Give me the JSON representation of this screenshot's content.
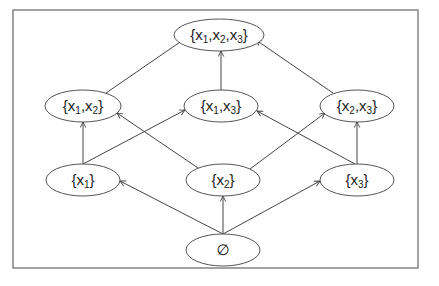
{
  "diagram": {
    "frame": {
      "x": 13,
      "y": 10,
      "width": 405,
      "height": 258
    },
    "nodes": [
      {
        "id": "top",
        "label_parts": [
          "{x",
          "1",
          ",x",
          "2",
          ",x",
          "3",
          "}"
        ],
        "cx": 219,
        "cy": 35,
        "rx": 45,
        "ry": 16
      },
      {
        "id": "x1x2",
        "label_parts": [
          "{x",
          "1",
          ",x",
          "2",
          "}"
        ],
        "cx": 83,
        "cy": 106,
        "rx": 38,
        "ry": 16
      },
      {
        "id": "x1x3",
        "label_parts": [
          "{x",
          "1",
          ",x",
          "3",
          "}"
        ],
        "cx": 221,
        "cy": 106,
        "rx": 37,
        "ry": 16
      },
      {
        "id": "x2x3",
        "label_parts": [
          "{x",
          "2",
          ",x",
          "3",
          "}"
        ],
        "cx": 357,
        "cy": 106,
        "rx": 37,
        "ry": 16
      },
      {
        "id": "x1",
        "label_parts": [
          "{x",
          "1",
          "}"
        ],
        "cx": 83,
        "cy": 180,
        "rx": 37,
        "ry": 16
      },
      {
        "id": "x2",
        "label_parts": [
          "{x",
          "2",
          "}"
        ],
        "cx": 223,
        "cy": 180,
        "rx": 37,
        "ry": 16
      },
      {
        "id": "x3",
        "label_parts": [
          "{x",
          "3",
          "}"
        ],
        "cx": 357,
        "cy": 180,
        "rx": 37,
        "ry": 16
      },
      {
        "id": "empty",
        "label_parts": [
          "∅"
        ],
        "cx": 223,
        "cy": 250,
        "rx": 37,
        "ry": 16
      }
    ],
    "edges": [
      {
        "from": "empty",
        "to": "x1",
        "x1": 223,
        "y1": 234,
        "x2": 120,
        "y2": 181
      },
      {
        "from": "empty",
        "to": "x2",
        "x1": 223,
        "y1": 234,
        "x2": 223,
        "y2": 196
      },
      {
        "from": "empty",
        "to": "x3",
        "x1": 223,
        "y1": 234,
        "x2": 320,
        "y2": 181
      },
      {
        "from": "x1",
        "to": "x1x2",
        "x1": 83,
        "y1": 164,
        "x2": 83,
        "y2": 122
      },
      {
        "from": "x1",
        "to": "x1x3",
        "x1": 83,
        "y1": 164,
        "x2": 185,
        "y2": 110
      },
      {
        "from": "x2",
        "to": "x1x2",
        "x1": 198,
        "y1": 168,
        "x2": 117,
        "y2": 113
      },
      {
        "from": "x2",
        "to": "x2x3",
        "x1": 250,
        "y1": 169,
        "x2": 325,
        "y2": 113
      },
      {
        "from": "x3",
        "to": "x1x3",
        "x1": 355,
        "y1": 164,
        "x2": 257,
        "y2": 111
      },
      {
        "from": "x3",
        "to": "x2x3",
        "x1": 357,
        "y1": 164,
        "x2": 357,
        "y2": 122
      },
      {
        "from": "x1x2",
        "to": "top",
        "x1": 106,
        "y1": 93,
        "x2": 186,
        "y2": 38
      },
      {
        "from": "x1x3",
        "to": "top",
        "x1": 221,
        "y1": 90,
        "x2": 221,
        "y2": 51
      },
      {
        "from": "x2x3",
        "to": "top",
        "x1": 333,
        "y1": 93,
        "x2": 256,
        "y2": 40
      }
    ]
  }
}
